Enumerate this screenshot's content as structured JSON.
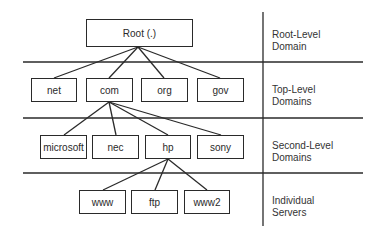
{
  "diagram": {
    "root": {
      "label": "Root (.)"
    },
    "top_level": [
      {
        "label": "net"
      },
      {
        "label": "com"
      },
      {
        "label": "org"
      },
      {
        "label": "gov"
      }
    ],
    "second_level": [
      {
        "label": "microsoft"
      },
      {
        "label": "nec"
      },
      {
        "label": "hp"
      },
      {
        "label": "sony"
      }
    ],
    "servers": [
      {
        "label": "www"
      },
      {
        "label": "ftp"
      },
      {
        "label": "www2"
      }
    ],
    "levels": [
      {
        "line1": "Root-Level",
        "line2": "Domain"
      },
      {
        "line1": "Top-Level",
        "line2": "Domains"
      },
      {
        "line1": "Second-Level",
        "line2": "Domains"
      },
      {
        "line1": "Individual",
        "line2": "Servers"
      }
    ],
    "edges": [
      [
        "Root (.)",
        "net"
      ],
      [
        "Root (.)",
        "com"
      ],
      [
        "Root (.)",
        "org"
      ],
      [
        "Root (.)",
        "gov"
      ],
      [
        "com",
        "microsoft"
      ],
      [
        "com",
        "nec"
      ],
      [
        "com",
        "hp"
      ],
      [
        "com",
        "sony"
      ],
      [
        "hp",
        "www"
      ],
      [
        "hp",
        "ftp"
      ],
      [
        "hp",
        "www2"
      ]
    ]
  }
}
